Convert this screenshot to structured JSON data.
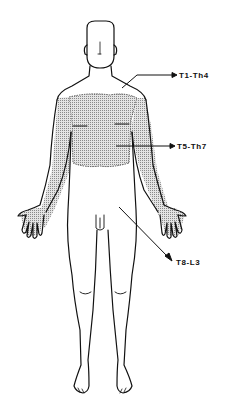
{
  "diagram": {
    "type": "dermatome-body-map",
    "view": "anterior",
    "colors": {
      "outline": "#111111",
      "shading": "#b8b8b8",
      "background": "#ffffff"
    },
    "labels": [
      {
        "id": "t1-th4",
        "text": "T1-Th4",
        "region": "neck-and-upper-chest"
      },
      {
        "id": "t5-th7",
        "text": "T5-Th7",
        "region": "chest-and-arms (shaded)"
      },
      {
        "id": "t8-l3",
        "text": "T8-L3",
        "region": "abdomen-and-legs"
      }
    ]
  }
}
